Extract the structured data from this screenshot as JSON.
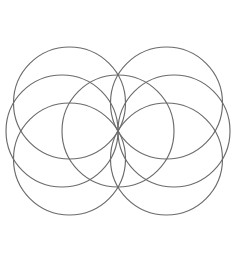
{
  "canvas": {
    "width": 234,
    "height": 258,
    "background_color": "#ffffff",
    "title": "Seed of Life"
  },
  "figure": {
    "name": "seed-of-life",
    "stroke_color": "#6b6b6b",
    "stroke_width": 1.15,
    "fill": "none",
    "center_x": 118,
    "center_y": 131,
    "radius": 56,
    "circle_count": 7,
    "bounds": {
      "left": 22,
      "top": 27,
      "right": 214,
      "bottom": 235
    }
  },
  "chart_data": {
    "type": "scatter",
    "xlabel": "",
    "ylabel": "",
    "xlim": [
      0,
      234
    ],
    "ylim": [
      258,
      0
    ],
    "grid": false,
    "legend": "none",
    "shape": "circle-outline",
    "radius": 56,
    "categories": [
      "center",
      "upper-left",
      "upper-right",
      "right",
      "lower-right",
      "lower-left",
      "left"
    ],
    "series": [
      {
        "name": "circle centers",
        "points": [
          {
            "label": "center",
            "cx": 118,
            "cy": 131,
            "r": 56
          },
          {
            "label": "upper-left",
            "cx": 69.5,
            "cy": 103,
            "r": 56
          },
          {
            "label": "upper-right",
            "cx": 166.5,
            "cy": 103,
            "r": 56
          },
          {
            "label": "right",
            "cx": 174,
            "cy": 131,
            "r": 56
          },
          {
            "label": "lower-right",
            "cx": 166.5,
            "cy": 159,
            "r": 56
          },
          {
            "label": "lower-left",
            "cx": 69.5,
            "cy": 159,
            "r": 56
          },
          {
            "label": "left",
            "cx": 62,
            "cy": 131,
            "r": 56
          }
        ]
      }
    ],
    "annotations": []
  }
}
